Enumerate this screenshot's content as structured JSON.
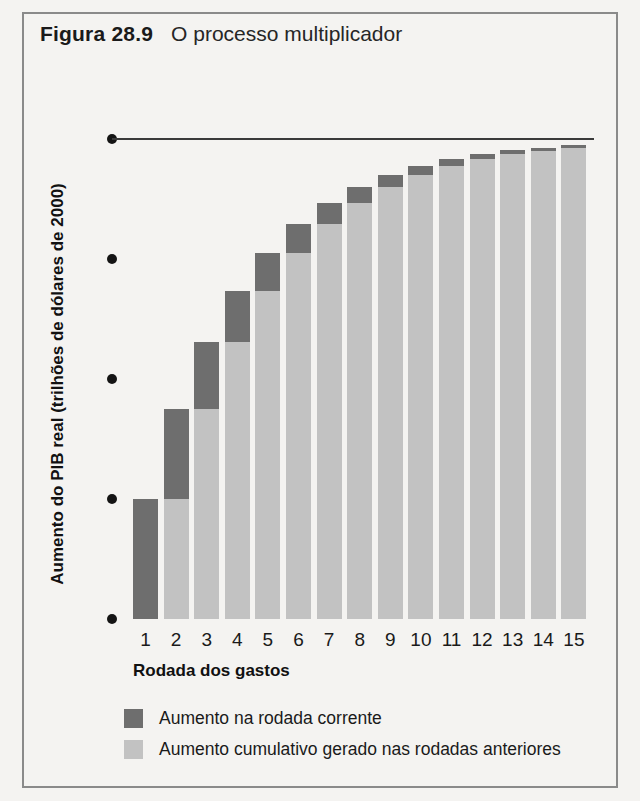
{
  "figure": {
    "number_label": "Figura 28.9",
    "caption": "O processo multiplicador"
  },
  "colors": {
    "current_round": "#6e6e6e",
    "previous_rounds": "#c2c2c2",
    "panel_background": "#f4f3f1",
    "frame": "#8a8a8a",
    "text": "#1a1a1a",
    "top_rule": "#3a3a3a"
  },
  "legend": {
    "position": "below-axis",
    "items": [
      {
        "swatch": "current-round-swatch",
        "label": "Aumento na rodada corrente",
        "color": "#6e6e6e"
      },
      {
        "swatch": "previous-rounds-swatch",
        "label": "Aumento cumulativo gerado nas rodadas anteriores",
        "color": "#c2c2c2"
      }
    ]
  },
  "chart_data": {
    "type": "bar",
    "title": "O processo multiplicador",
    "xlabel": "Rodada dos gastos",
    "ylabel": "Aumento do PIB real (trilhões de dólares de 2000)",
    "categories": [
      "1",
      "2",
      "3",
      "4",
      "5",
      "6",
      "7",
      "8",
      "9",
      "10",
      "11",
      "12",
      "13",
      "14",
      "15"
    ],
    "ylim": [
      0,
      2.0
    ],
    "yticks": [
      0,
      0.5,
      1.0,
      1.5,
      2.0
    ],
    "ytick_labels": [
      "0",
      "0,5",
      "1,0",
      "1,5",
      "2,0"
    ],
    "grid": false,
    "reference_line": {
      "value": 2.0,
      "label": "2,0"
    },
    "stacked": true,
    "series": [
      {
        "name": "Aumento cumulativo gerado nas rodadas anteriores",
        "color": "#c2c2c2",
        "values": [
          0.0,
          0.5,
          0.875,
          1.156,
          1.367,
          1.525,
          1.644,
          1.733,
          1.8,
          1.85,
          1.887,
          1.915,
          1.937,
          1.952,
          1.964
        ]
      },
      {
        "name": "Aumento na rodada corrente",
        "color": "#6e6e6e",
        "values": [
          0.5,
          0.375,
          0.281,
          0.211,
          0.158,
          0.119,
          0.089,
          0.067,
          0.05,
          0.037,
          0.028,
          0.021,
          0.016,
          0.012,
          0.009
        ]
      }
    ],
    "totals": [
      0.5,
      0.875,
      1.156,
      1.367,
      1.525,
      1.644,
      1.733,
      1.8,
      1.85,
      1.887,
      1.915,
      1.937,
      1.952,
      1.964,
      1.973
    ]
  }
}
